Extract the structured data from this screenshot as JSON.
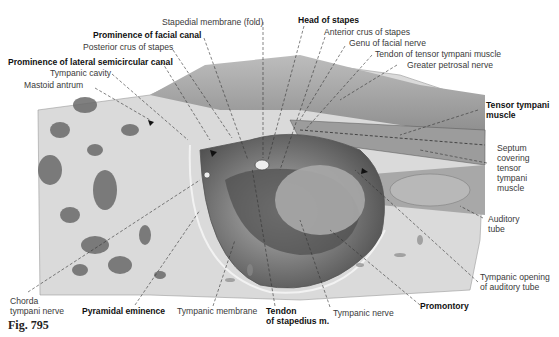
{
  "figure": {
    "caption": "Fig. 795",
    "colors": {
      "background": "#ffffff",
      "bone": "#d9d9d9",
      "shadow": "#6a6a6a",
      "line": "#333333"
    }
  },
  "labels": {
    "stapedial_membrane": "Stapedial membrane (fold)",
    "head_of_stapes": "Head of stapes",
    "prominence_facial_canal": "Prominence of facial canal",
    "anterior_crus": "Anterior crus of stapes",
    "posterior_crus": "Posterior crus of stapes",
    "genu_facial_nerve": "Genu of facial nerve",
    "tendon_tensor_tympani": "Tendon of tensor tympani muscle",
    "prominence_lateral_canal": "Prominence of lateral semicircular canal",
    "greater_petrosal": "Greater petrosal nerve",
    "tympanic_cavity": "Tympanic cavity",
    "mastoid_antrum": "Mastoid antrum",
    "tensor_tympani_1": "Tensor tympani",
    "tensor_tympani_2": "muscle",
    "septum_1": "Septum",
    "septum_2": "covering",
    "septum_3": "tensor",
    "septum_4": "tympani",
    "septum_5": "muscle",
    "auditory_tube_1": "Auditory",
    "auditory_tube_2": "tube",
    "tympanic_opening_1": "Tympanic opening",
    "tympanic_opening_2": "of auditory tube",
    "chorda_1": "Chorda",
    "chorda_2": "tympani nerve",
    "pyramidal": "Pyramidal eminence",
    "tympanic_membrane": "Tympanic membrane",
    "tendon_stapedius_1": "Tendon",
    "tendon_stapedius_2": "of stapedius m.",
    "tympanic_nerve": "Tympanic nerve",
    "promontory": "Promontory"
  }
}
